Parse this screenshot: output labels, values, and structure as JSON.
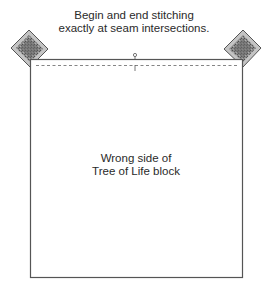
{
  "caption": {
    "line1": "Begin and end stitching",
    "line2": "exactly at seam intersections."
  },
  "block_label": {
    "line1": "Wrong side of",
    "line2": "Tree of Life block"
  },
  "colors": {
    "outline": "#555555",
    "seam": "#666666",
    "fabric_dark": "#6e6e6e",
    "fabric_light": "#bdbdbd"
  }
}
